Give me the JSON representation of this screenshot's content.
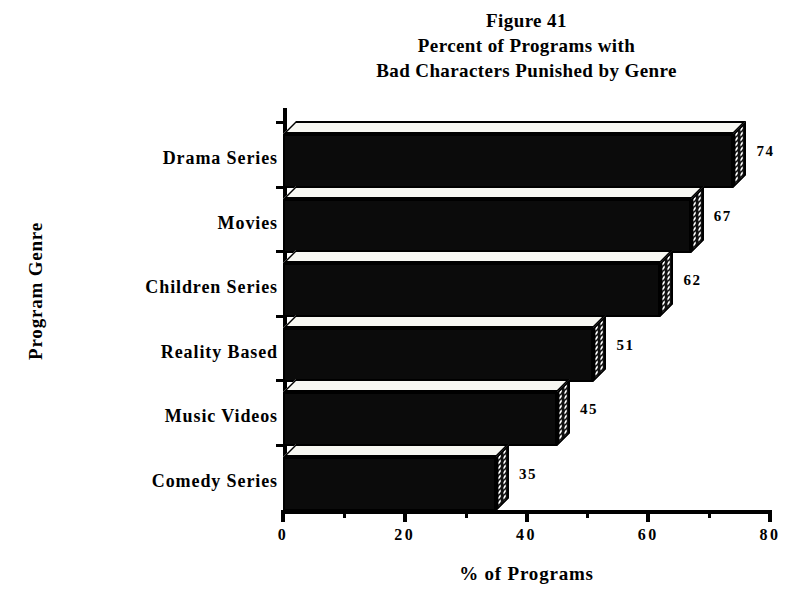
{
  "chart_data": {
    "type": "bar",
    "orientation": "horizontal",
    "title": "Figure 41\nPercent of Programs with\nBad Characters Punished by Genre",
    "title_lines": [
      "Figure 41",
      "Percent of Programs with",
      "Bad Characters Punished by Genre"
    ],
    "figure_number": "Figure 41",
    "categories": [
      "Drama Series",
      "Movies",
      "Children Series",
      "Reality Based",
      "Music Videos",
      "Comedy Series"
    ],
    "values": [
      74,
      67,
      62,
      51,
      45,
      35
    ],
    "data_labels": [
      "74",
      "67",
      "62",
      "51",
      "45",
      "35"
    ],
    "xlabel": "% of Programs",
    "ylabel": "Program Genre",
    "xlim": [
      0,
      80
    ],
    "xticks": [
      0,
      20,
      40,
      60,
      80
    ],
    "xtick_labels": [
      "0",
      "20",
      "40",
      "60",
      "80"
    ],
    "minor_xticks": [
      10,
      30,
      50,
      70
    ],
    "grid": false,
    "legend": false,
    "style": "3d-bar",
    "bar_color": "#0b0b0b",
    "bar_top_color": "#f7f7f2",
    "bar_side_pattern": "halftone-dots",
    "background": "#ffffff",
    "axis_color": "#000000"
  }
}
